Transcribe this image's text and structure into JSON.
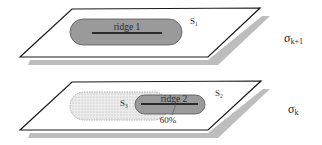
{
  "diagram": {
    "planes": [
      {
        "id": "upper",
        "scale_label": "σ",
        "scale_subscript": "k+1",
        "region_label": "S",
        "region_subscript": "1",
        "ridge": {
          "label": "ridge 1"
        }
      },
      {
        "id": "lower",
        "scale_label": "σ",
        "scale_subscript": "k",
        "region_label": "S",
        "region_subscript": "2",
        "overlap_region_label": "S",
        "overlap_region_subscript": "3",
        "ridge": {
          "label": "ridge 2"
        },
        "overlap_percent": "60%"
      }
    ],
    "colors": {
      "plane_fill": "#ffffff",
      "plane_stroke": "#1a1a1a",
      "shadow": "#bdbdbd",
      "ridge_fill": "#9a9a9a",
      "ridge_line": "#2b2b2b",
      "overlap_fill": "#e4e4e4"
    }
  }
}
